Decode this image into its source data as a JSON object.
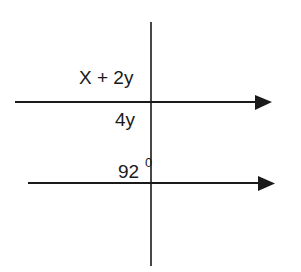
{
  "diagram": {
    "type": "parallel-lines-with-transversal",
    "colors": {
      "line": "#1a1a1a",
      "background": "#ffffff"
    },
    "lines": {
      "upper_parallel": {
        "x1": 15,
        "y": 102,
        "x2": 256,
        "arrow": "right"
      },
      "lower_parallel": {
        "x1": 28,
        "y": 183,
        "x2": 259,
        "arrow": "right"
      },
      "transversal": {
        "x": 151,
        "y1": 22,
        "y2": 266
      }
    },
    "labels": {
      "upper_top": "X + 2y",
      "upper_bottom": "4y",
      "lower_angle": "92",
      "lower_angle_unit": "0"
    }
  }
}
